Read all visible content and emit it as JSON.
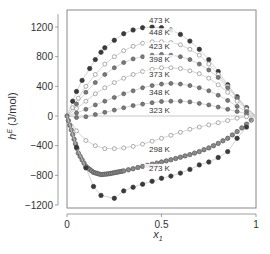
{
  "chart_data": {
    "type": "scatter",
    "title": "",
    "xlabel": "x1",
    "ylabel": "hE (J/mol)",
    "xlim": [
      0,
      1
    ],
    "ylim": [
      -1200,
      1400
    ],
    "xticks": [
      0,
      0.5,
      1
    ],
    "xtick_labels": [
      "0",
      "0.5",
      "1"
    ],
    "yticks": [
      -1200,
      -800,
      -400,
      0,
      400,
      800,
      1200
    ],
    "ytick_labels": [
      "-1200",
      "-800",
      "-400",
      "0",
      "400",
      "800",
      "1200"
    ],
    "grid": false,
    "zero_line": true,
    "series": [
      {
        "name": "473 K",
        "marker": "filled-dark",
        "label_pos": [
          0.5,
          1260
        ],
        "x": [
          0,
          0.03,
          0.05,
          0.08,
          0.12,
          0.15,
          0.18,
          0.2,
          0.25,
          0.3,
          0.35,
          0.4,
          0.45,
          0.5,
          0.55,
          0.6,
          0.65,
          0.7,
          0.75,
          0.8,
          0.85,
          0.9,
          0.95,
          1
        ],
        "y": [
          0,
          200,
          330,
          480,
          640,
          760,
          860,
          920,
          1020,
          1110,
          1160,
          1190,
          1200,
          1190,
          1160,
          1100,
          1010,
          900,
          760,
          600,
          420,
          260,
          110,
          0
        ]
      },
      {
        "name": "448 K",
        "marker": "open",
        "label_pos": [
          0.5,
          1090
        ],
        "x": [
          0,
          0.03,
          0.06,
          0.1,
          0.15,
          0.2,
          0.25,
          0.3,
          0.35,
          0.4,
          0.45,
          0.5,
          0.55,
          0.6,
          0.65,
          0.7,
          0.75,
          0.8,
          0.85,
          0.9,
          0.95,
          1
        ],
        "y": [
          0,
          110,
          240,
          400,
          560,
          700,
          800,
          880,
          940,
          980,
          1000,
          1000,
          990,
          960,
          900,
          820,
          700,
          560,
          400,
          240,
          100,
          0
        ]
      },
      {
        "name": "423 K",
        "marker": "filled-mid",
        "label_pos": [
          0.5,
          900
        ],
        "x": [
          0,
          0.05,
          0.1,
          0.15,
          0.2,
          0.25,
          0.3,
          0.35,
          0.4,
          0.45,
          0.5,
          0.55,
          0.6,
          0.65,
          0.7,
          0.75,
          0.8,
          0.85,
          0.9,
          0.95,
          1
        ],
        "y": [
          0,
          160,
          320,
          450,
          560,
          650,
          720,
          770,
          800,
          820,
          830,
          820,
          800,
          760,
          700,
          620,
          520,
          380,
          240,
          110,
          0
        ]
      },
      {
        "name": "398 K",
        "marker": "open",
        "label_pos": [
          0.5,
          730
        ],
        "x": [
          0,
          0.05,
          0.1,
          0.15,
          0.2,
          0.25,
          0.3,
          0.35,
          0.4,
          0.45,
          0.5,
          0.55,
          0.6,
          0.65,
          0.7,
          0.75,
          0.8,
          0.85,
          0.9,
          0.95,
          1
        ],
        "y": [
          0,
          100,
          200,
          300,
          380,
          450,
          510,
          560,
          600,
          630,
          650,
          650,
          640,
          610,
          570,
          510,
          420,
          320,
          200,
          90,
          0
        ]
      },
      {
        "name": "373 K",
        "marker": "filled-mid",
        "label_pos": [
          0.5,
          520
        ],
        "x": [
          0,
          0.05,
          0.1,
          0.15,
          0.2,
          0.25,
          0.3,
          0.35,
          0.4,
          0.45,
          0.5,
          0.55,
          0.6,
          0.65,
          0.7,
          0.75,
          0.8,
          0.85,
          0.9,
          0.95,
          1
        ],
        "y": [
          0,
          40,
          90,
          150,
          200,
          250,
          300,
          340,
          380,
          410,
          430,
          440,
          430,
          410,
          380,
          340,
          280,
          210,
          130,
          60,
          0
        ]
      },
      {
        "name": "348 K",
        "marker": "filled-mid",
        "label_pos": [
          0.5,
          280
        ],
        "x": [
          0,
          0.05,
          0.1,
          0.15,
          0.2,
          0.25,
          0.3,
          0.35,
          0.4,
          0.45,
          0.5,
          0.55,
          0.6,
          0.65,
          0.7,
          0.75,
          0.8,
          0.85,
          0.9,
          0.95,
          1
        ],
        "y": [
          0,
          -20,
          -10,
          20,
          50,
          80,
          110,
          140,
          160,
          180,
          195,
          200,
          200,
          190,
          170,
          150,
          120,
          90,
          60,
          30,
          0
        ]
      },
      {
        "name": "323 K",
        "marker": "open",
        "label_pos": [
          0.5,
          40
        ],
        "x": [
          0,
          0.05,
          0.1,
          0.15,
          0.2,
          0.25,
          0.3,
          0.35,
          0.4,
          0.45,
          0.5,
          0.55,
          0.6,
          0.65,
          0.7,
          0.75,
          0.8,
          0.85,
          0.9,
          0.95,
          1
        ],
        "y": [
          0,
          -200,
          -330,
          -400,
          -440,
          -440,
          -430,
          -410,
          -380,
          -340,
          -300,
          -260,
          -220,
          -180,
          -150,
          -120,
          -90,
          -60,
          -30,
          -10,
          0
        ]
      },
      {
        "name": "298 K",
        "marker": "filled-dense",
        "label_pos": [
          0.5,
          -480
        ],
        "x": [
          0,
          0.03,
          0.06,
          0.1,
          0.14,
          0.18,
          0.22,
          0.26,
          0.3,
          0.35,
          0.4,
          0.45,
          0.5,
          0.55,
          0.6,
          0.65,
          0.7,
          0.75,
          0.8,
          0.85,
          0.9,
          0.95,
          1
        ],
        "y": [
          0,
          -250,
          -500,
          -680,
          -760,
          -790,
          -780,
          -760,
          -740,
          -710,
          -680,
          -650,
          -620,
          -590,
          -555,
          -520,
          -480,
          -430,
          -370,
          -300,
          -210,
          -110,
          0
        ]
      },
      {
        "name": "273 K",
        "marker": "filled-dark",
        "label_pos": [
          0.5,
          -740
        ],
        "x": [
          0,
          0.05,
          0.1,
          0.14,
          0.18,
          0.25,
          0.3,
          0.35,
          0.4,
          0.45,
          0.5,
          0.55,
          0.6,
          0.65,
          0.7,
          0.75,
          0.8,
          0.85,
          0.9,
          0.95,
          1
        ],
        "y": [
          0,
          -420,
          -700,
          -950,
          -1070,
          -1110,
          -1010,
          -960,
          -920,
          -880,
          -840,
          -810,
          -770,
          -720,
          -660,
          -620,
          -560,
          -480,
          -300,
          -150,
          0
        ]
      }
    ]
  },
  "labels": {
    "x_axis_title": "x",
    "x_axis_sub": "1",
    "y_axis_title": "h",
    "y_axis_sup": "E",
    "y_axis_unit": " (J/mol)"
  }
}
